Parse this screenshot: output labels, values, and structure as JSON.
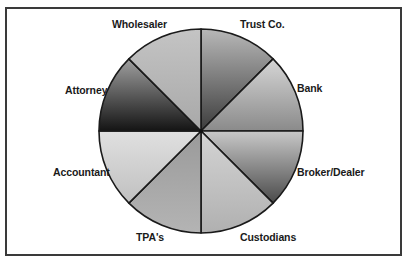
{
  "diagram": {
    "type": "wheel",
    "center": "Financial intermediaries",
    "segments": [
      {
        "label": "Trust Co.",
        "shade": "dark-to-mid"
      },
      {
        "label": "Bank",
        "shade": "light-to-mid"
      },
      {
        "label": "Broker/Dealer",
        "shade": "light-to-dark"
      },
      {
        "label": "Custodians",
        "shade": "light"
      },
      {
        "label": "TPA's",
        "shade": "mid"
      },
      {
        "label": "Accountant",
        "shade": "light"
      },
      {
        "label": "Attorney",
        "shade": "dark"
      },
      {
        "label": "Wholesaler",
        "shade": "light"
      }
    ]
  },
  "labels": {
    "trust": "Trust Co.",
    "bank": "Bank",
    "broker": "Broker/Dealer",
    "custodians": "Custodians",
    "tpas": "TPA's",
    "accountant": "Accountant",
    "attorney": "Attorney",
    "wholesaler": "Wholesaler"
  },
  "colors": {
    "outline": "#1a1a1a",
    "frame": "#3a3a3a"
  }
}
